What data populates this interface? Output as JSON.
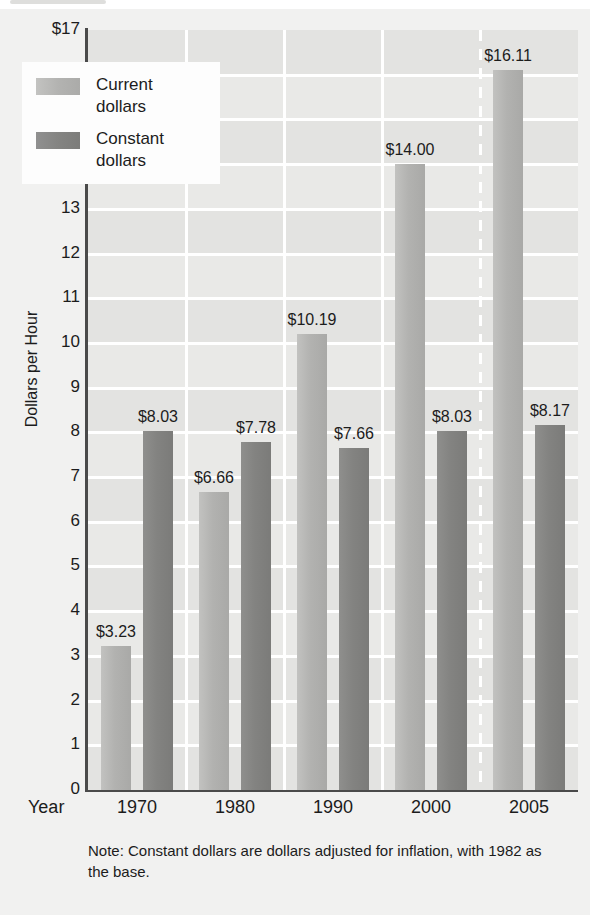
{
  "chart_data": {
    "type": "bar",
    "title": "",
    "subtitle": "",
    "xlabel": "Year",
    "ylabel": "Dollars per Hour",
    "categories": [
      "1970",
      "1980",
      "1990",
      "2000",
      "2005"
    ],
    "series": [
      {
        "name": "Current dollars",
        "color": "#b2b2b0",
        "values": [
          3.23,
          6.66,
          10.19,
          14.0,
          16.11
        ],
        "labels": [
          "$3.23",
          "$6.66",
          "$10.19",
          "$14.00",
          "$16.11"
        ]
      },
      {
        "name": "Constant dollars",
        "color": "#838381",
        "values": [
          8.03,
          7.78,
          7.66,
          8.03,
          8.17
        ],
        "labels": [
          "$8.03",
          "$7.78",
          "$7.66",
          "$8.03",
          "$8.17"
        ]
      }
    ],
    "ylim": [
      0,
      17
    ],
    "yticks": [
      0,
      1,
      2,
      3,
      4,
      5,
      6,
      7,
      8,
      9,
      10,
      11,
      12,
      13,
      14,
      15,
      16,
      17
    ],
    "ytick_labels": [
      "0",
      "1",
      "2",
      "3",
      "4",
      "5",
      "6",
      "7",
      "8",
      "9",
      "10",
      "11",
      "12",
      "13",
      "14",
      "15",
      "16",
      "$17"
    ],
    "grid": true,
    "grid_axis": "both",
    "grid_color": "#ffffff",
    "plot_background": "#e3e3e1",
    "legend_position": "upper-left-inside",
    "annotations": [
      {
        "type": "vertical-dashed-line",
        "between": [
          "2000",
          "2005"
        ],
        "color": "#ffffff"
      }
    ]
  },
  "axis": {
    "x_title": "Year",
    "y_title": "Dollars per Hour",
    "y_top_label": "$17"
  },
  "legend": {
    "entries": [
      {
        "label_line1": "Current",
        "label_line2": "dollars",
        "swatch": "current"
      },
      {
        "label_line1": "Constant",
        "label_line2": "dollars",
        "swatch": "constant"
      }
    ]
  },
  "footnote": {
    "text": "Note:  Constant dollars are dollars adjusted for inflation, with 1982 as the base."
  }
}
